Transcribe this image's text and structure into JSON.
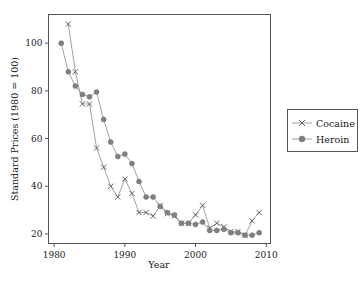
{
  "chart_data": {
    "type": "line",
    "title": "",
    "xlabel": "Year",
    "ylabel": "Standard Prices (1980 = 100)",
    "xlim": [
      1979.2,
      2010.6
    ],
    "ylim": [
      16,
      112
    ],
    "xticks": [
      1980,
      1990,
      2000,
      2010
    ],
    "yticks": [
      20,
      40,
      60,
      80,
      100
    ],
    "xtick_labels": [
      "1980",
      "1990",
      "2000",
      "2010"
    ],
    "ytick_labels": [
      "20",
      "40",
      "60",
      "80",
      "100"
    ],
    "grid": false,
    "legend_position": "right",
    "series": [
      {
        "name": "Cocaine",
        "marker": "x",
        "color": "#555555",
        "x": [
          1982,
          1983,
          1984,
          1985,
          1986,
          1987,
          1988,
          1989,
          1990,
          1991,
          1992,
          1993,
          1994,
          1995,
          1996,
          1997,
          1998,
          1999,
          2000,
          2001,
          2002,
          2003,
          2004,
          2005,
          2006,
          2007,
          2008,
          2009
        ],
        "values": [
          108,
          88,
          74.5,
          74.5,
          56,
          48,
          40,
          35.5,
          43,
          37,
          29,
          29,
          27.5,
          32,
          28.5,
          27.5,
          24.5,
          24.5,
          28,
          32,
          22.5,
          24.5,
          23,
          21,
          21,
          19.5,
          25.5,
          29
        ]
      },
      {
        "name": "Heroin",
        "marker": "circle",
        "color": "#808080",
        "x": [
          1981,
          1982,
          1983,
          1984,
          1985,
          1986,
          1987,
          1988,
          1989,
          1990,
          1991,
          1992,
          1993,
          1994,
          1995,
          1996,
          1997,
          1998,
          1999,
          2000,
          2001,
          2002,
          2003,
          2004,
          2005,
          2006,
          2007,
          2008,
          2009
        ],
        "values": [
          100,
          88,
          82,
          78.5,
          77.5,
          79.5,
          68,
          58.5,
          52.5,
          53.5,
          49.5,
          42,
          35.5,
          35.5,
          31.5,
          29,
          28,
          24.5,
          24.5,
          24,
          25,
          21.5,
          21.5,
          22,
          20.5,
          20.5,
          19.5,
          19.5,
          20.5
        ]
      }
    ]
  },
  "legend": {
    "entries": [
      {
        "label": "Cocaine",
        "marker": "x"
      },
      {
        "label": "Heroin",
        "marker": "circle"
      }
    ]
  }
}
